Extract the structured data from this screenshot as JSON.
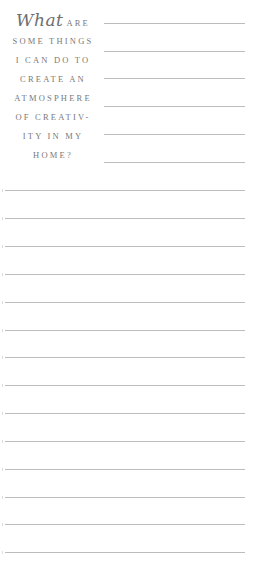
{
  "prompt": {
    "script_word": "What",
    "lines": [
      "ARE",
      "SOME THINGS",
      "I CAN DO TO",
      "CREATE AN",
      "ATMOSPHERE",
      "OF CREATIV-",
      "ITY IN MY",
      "HOME?"
    ]
  },
  "writing_area": {
    "short_lines_count": 6,
    "full_lines_count": 14
  },
  "colors": {
    "text": "#7a7a7a",
    "rule": "#bcbcbc",
    "background": "#ffffff"
  }
}
